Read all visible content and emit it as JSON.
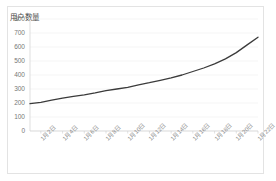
{
  "chart_data": {
    "type": "line",
    "title": "用户数量",
    "xlabel": "",
    "ylabel": "",
    "ylim": [
      0,
      800
    ],
    "yticks": [
      0,
      100,
      200,
      300,
      400,
      500,
      600,
      700,
      800
    ],
    "grid": true,
    "legend": false,
    "legend_position": "none",
    "line_color": "#3b3b3b",
    "categories": [
      "1月1日",
      "1月2日",
      "1月3日",
      "1月4日",
      "1月5日",
      "1月6日",
      "1月7日",
      "1月8日",
      "1月9日",
      "1月10日",
      "1月11日",
      "1月12日",
      "1月13日",
      "1月14日",
      "1月15日",
      "1月16日",
      "1月17日",
      "1月18日",
      "1月19日",
      "1月20日",
      "1月21日",
      "1月22日"
    ],
    "xticklabels": [
      "1月2日",
      "1月4日",
      "1月6日",
      "1月8日",
      "1月10日",
      "1月12日",
      "1月14日",
      "1月16日",
      "1月18日",
      "1月20日",
      "1月22日"
    ],
    "values": [
      195,
      205,
      220,
      235,
      248,
      258,
      272,
      288,
      300,
      312,
      330,
      345,
      362,
      380,
      400,
      425,
      450,
      480,
      515,
      560,
      615,
      670
    ]
  }
}
